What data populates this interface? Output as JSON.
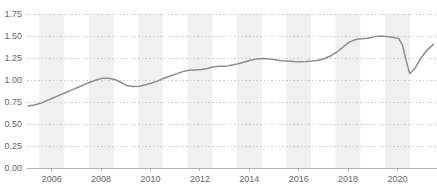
{
  "chart_data": {
    "type": "line",
    "title": "",
    "subtitle": "",
    "xlabel": "",
    "ylabel": "",
    "xlim": [
      2005.0,
      2021.6
    ],
    "ylim": [
      0.0,
      1.75
    ],
    "grid": true,
    "grid_style": "dotted-horizontal",
    "legend": false,
    "legend_position": "none",
    "line_color": "#8d8d8d",
    "band_color": "#f0f0f0",
    "grid_color": "#cccccc",
    "axis_color": "#b0b0b0",
    "tick_label_color": "#666666",
    "ytick_labels": [
      "0.00",
      "0.25",
      "0.50",
      "0.75",
      "1.00",
      "1.25",
      "1.50",
      "1.75"
    ],
    "ytick_values": [
      0.0,
      0.25,
      0.5,
      0.75,
      1.0,
      1.25,
      1.5,
      1.75
    ],
    "xtick_labels": [
      "2006",
      "2008",
      "2010",
      "2012",
      "2014",
      "2016",
      "2018",
      "2020"
    ],
    "xtick_values": [
      2006,
      2008,
      2010,
      2012,
      2014,
      2016,
      2018,
      2020
    ],
    "shaded_bands": [
      [
        2005.5,
        2006.5
      ],
      [
        2007.5,
        2008.5
      ],
      [
        2009.5,
        2010.5
      ],
      [
        2011.5,
        2012.5
      ],
      [
        2013.5,
        2014.5
      ],
      [
        2015.5,
        2016.5
      ],
      [
        2017.5,
        2018.5
      ],
      [
        2019.5,
        2020.5
      ]
    ],
    "series": [
      {
        "name": "value",
        "x": [
          2005.05,
          2005.3,
          2005.55,
          2005.8,
          2006.05,
          2006.3,
          2006.55,
          2006.8,
          2007.05,
          2007.3,
          2007.55,
          2007.8,
          2008.05,
          2008.3,
          2008.55,
          2008.8,
          2009.05,
          2009.3,
          2009.55,
          2009.8,
          2010.05,
          2010.3,
          2010.55,
          2010.8,
          2011.05,
          2011.3,
          2011.55,
          2011.8,
          2012.05,
          2012.3,
          2012.55,
          2012.8,
          2013.05,
          2013.3,
          2013.55,
          2013.8,
          2014.05,
          2014.3,
          2014.55,
          2014.8,
          2015.05,
          2015.3,
          2015.55,
          2015.8,
          2016.05,
          2016.3,
          2016.55,
          2016.8,
          2017.05,
          2017.3,
          2017.55,
          2017.8,
          2018.05,
          2018.3,
          2018.55,
          2018.8,
          2019.05,
          2019.3,
          2019.55,
          2019.8,
          2020.05,
          2020.2,
          2020.35,
          2020.5,
          2020.7,
          2020.95,
          2021.2,
          2021.45
        ],
        "y": [
          0.705,
          0.715,
          0.735,
          0.765,
          0.795,
          0.825,
          0.855,
          0.885,
          0.915,
          0.945,
          0.975,
          1.0,
          1.02,
          1.02,
          1.005,
          0.975,
          0.935,
          0.925,
          0.93,
          0.945,
          0.965,
          0.99,
          1.02,
          1.045,
          1.07,
          1.095,
          1.11,
          1.115,
          1.12,
          1.13,
          1.15,
          1.155,
          1.155,
          1.17,
          1.185,
          1.205,
          1.225,
          1.24,
          1.245,
          1.24,
          1.23,
          1.22,
          1.215,
          1.21,
          1.208,
          1.21,
          1.215,
          1.225,
          1.245,
          1.275,
          1.32,
          1.375,
          1.43,
          1.46,
          1.47,
          1.475,
          1.49,
          1.5,
          1.495,
          1.485,
          1.47,
          1.4,
          1.22,
          1.07,
          1.13,
          1.25,
          1.34,
          1.405
        ]
      }
    ]
  },
  "axes": {
    "left_margin": 27,
    "right_margin": 0,
    "top_margin": 14,
    "bottom_margin": 21
  }
}
